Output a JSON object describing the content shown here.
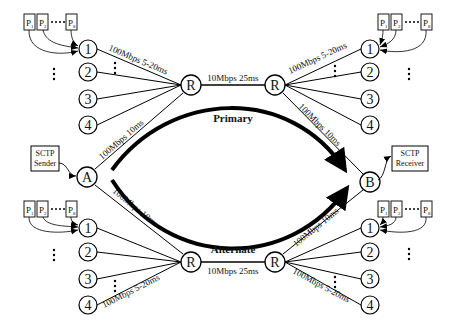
{
  "diagram": {
    "sender": {
      "line1": "SCTP",
      "line2": "Sender"
    },
    "receiver": {
      "line1": "SCTP",
      "line2": "Receiver"
    },
    "endpoints": {
      "a": "A",
      "b": "B"
    },
    "router_label": "R",
    "cross_nodes": [
      "1",
      "2",
      "3",
      "4"
    ],
    "packet_boxes": {
      "p": "P",
      "s1": "1",
      "s2": "2",
      "s3": "8"
    },
    "paths": {
      "primary": "Primary",
      "alternate": "Alternate"
    },
    "links": {
      "access": "100Mbps 5-20ms",
      "edge": "100Mbps 10ms",
      "bottleneck": "10Mbps 25ms"
    }
  }
}
